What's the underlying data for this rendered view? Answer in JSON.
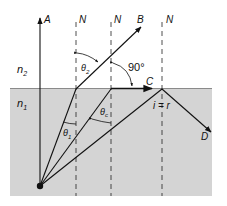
{
  "diagram": {
    "media": {
      "upper": {
        "label": "n",
        "subscript": "2",
        "color": "#ffffff"
      },
      "lower": {
        "label": "n",
        "subscript": "1",
        "color": "#d4d4d4"
      }
    },
    "rays": {
      "normal_ray": {
        "label": "A"
      },
      "refracted_ray": {
        "label": "B"
      },
      "critical_ray": {
        "label": "C"
      },
      "reflected_ray": {
        "label": "D"
      }
    },
    "normals": [
      {
        "label": "N"
      },
      {
        "label": "N"
      },
      {
        "label": "N"
      }
    ],
    "angles": {
      "theta_1": {
        "symbol": "θ",
        "subscript": "1"
      },
      "theta_2": {
        "symbol": "θ",
        "subscript": "2"
      },
      "theta_c": {
        "symbol": "θ",
        "subscript": "c"
      },
      "right_angle": "90°",
      "reflection_law": "i = r"
    },
    "colors": {
      "line": "#111111",
      "lower_medium": "#d4d4d4",
      "boundary": "#8a8a8a"
    }
  }
}
